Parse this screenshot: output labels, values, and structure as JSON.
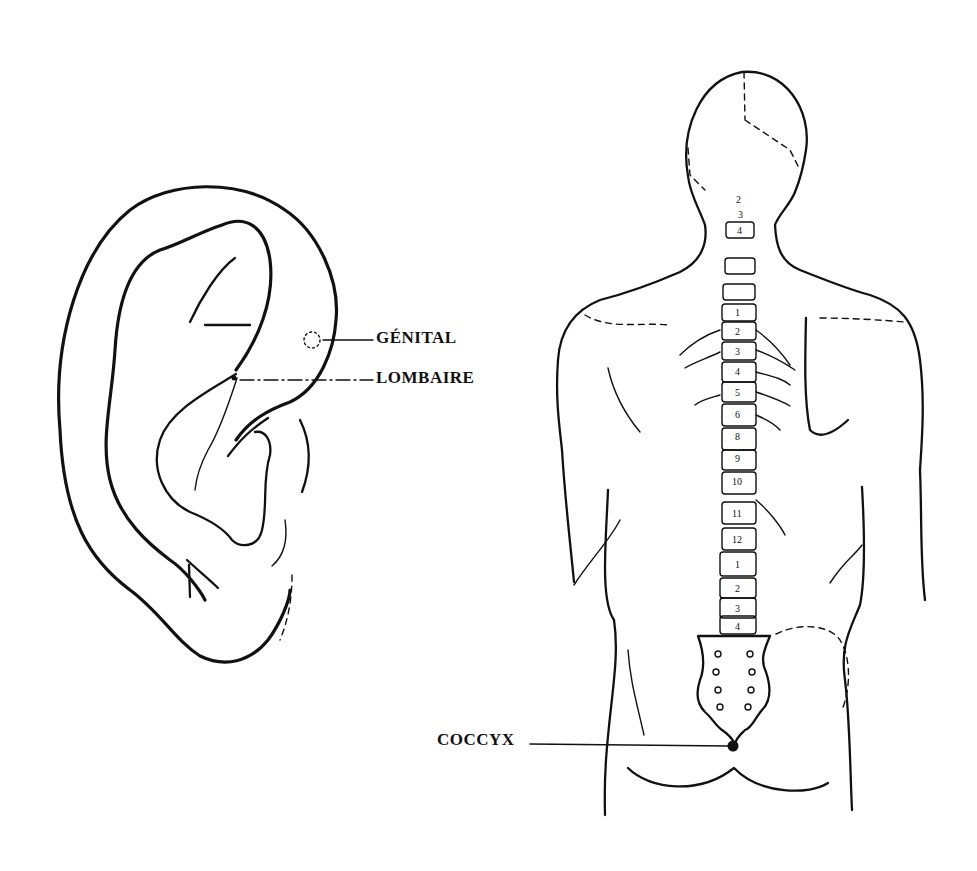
{
  "figures": {
    "ear": {
      "name": "auricle-front-view",
      "annotations": [
        {
          "id": "genital",
          "label": "GÉNITAL",
          "marker": "dashed-circle"
        },
        {
          "id": "lombaire",
          "label": "LOMBAIRE",
          "marker": "dot"
        }
      ]
    },
    "back": {
      "name": "human-back-spine-view",
      "annotations": [
        {
          "id": "coccyx",
          "label": "COCCYX",
          "marker": "filled-dot"
        }
      ],
      "vertebrae_labels": {
        "cervical": [
          "2",
          "3",
          "4"
        ],
        "thoracic": [
          "1",
          "2",
          "3",
          "4",
          "5",
          "6",
          "8",
          "9",
          "10",
          "11",
          "12"
        ],
        "lumbar": [
          "1",
          "2",
          "3",
          "4",
          "5"
        ]
      }
    }
  },
  "colors": {
    "ink": "#111111",
    "background": "#ffffff"
  }
}
